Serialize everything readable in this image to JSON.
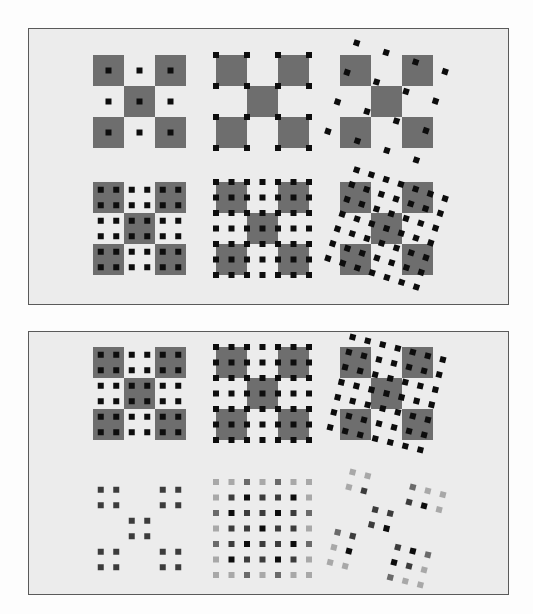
{
  "figure": {
    "colors": {
      "page_background": "#fdfdfd",
      "frame_background": "#ececec",
      "frame_border": "#5a5a5a",
      "checker_cell": "#6e6e6e",
      "sample_dark": "#0d0d0d",
      "sample_mid": "#3c3c3c",
      "sample_gray": "#6a6a6a",
      "sample_light": "#a8a8a8"
    },
    "panels": [
      {
        "id": "top",
        "rows": [
          [
            {
              "name": "checker-1x-centered",
              "samples_per_cell": 1,
              "placement": "cell-center",
              "rotation_deg": 0,
              "show_checker": true
            },
            {
              "name": "checker-1x-corner",
              "samples_per_cell": 1,
              "placement": "cell-corner",
              "rotation_deg": 0,
              "show_checker": true
            },
            {
              "name": "checker-1x-rotated",
              "samples_per_cell": 1,
              "placement": "rotated",
              "rotation_deg": 18,
              "show_checker": true
            }
          ],
          [
            {
              "name": "checker-2x-centered",
              "samples_per_cell": 2,
              "placement": "cell-center",
              "rotation_deg": 0,
              "show_checker": true
            },
            {
              "name": "checker-2x-corner",
              "samples_per_cell": 2,
              "placement": "cell-corner",
              "rotation_deg": 0,
              "show_checker": true
            },
            {
              "name": "checker-2x-rotated",
              "samples_per_cell": 2,
              "placement": "rotated",
              "rotation_deg": 18,
              "show_checker": true
            }
          ]
        ]
      },
      {
        "id": "bottom",
        "rows": [
          [
            {
              "name": "checker-2x-centered",
              "samples_per_cell": 2,
              "placement": "cell-center",
              "rotation_deg": 0,
              "show_checker": true
            },
            {
              "name": "checker-2x-corner",
              "samples_per_cell": 2,
              "placement": "cell-corner",
              "rotation_deg": 0,
              "show_checker": true
            },
            {
              "name": "checker-2x-rotated",
              "samples_per_cell": 2,
              "placement": "rotated",
              "rotation_deg": 14,
              "show_checker": true
            }
          ],
          [
            {
              "name": "samples-2x-centered",
              "samples_per_cell": 2,
              "placement": "cell-center",
              "rotation_deg": 0,
              "show_checker": false,
              "shaded": false
            },
            {
              "name": "samples-2x-corner-shaded",
              "samples_per_cell": 2,
              "placement": "cell-corner",
              "rotation_deg": 0,
              "show_checker": false,
              "shaded": true
            },
            {
              "name": "samples-2x-rotated-shaded",
              "samples_per_cell": 2,
              "placement": "rotated",
              "rotation_deg": 14,
              "show_checker": false,
              "shaded": true
            }
          ]
        ]
      }
    ]
  }
}
